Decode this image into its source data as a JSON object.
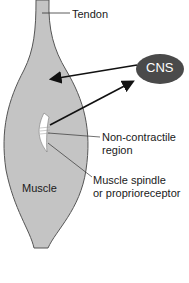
{
  "labels": {
    "tendon": "Tendon",
    "cns": "CNS",
    "non_contractile_line1": "Non-contractile",
    "non_contractile_line2": "region",
    "spindle_line1": "Muscle spindle",
    "spindle_line2": "or proprioreceptor",
    "muscle": "Muscle"
  },
  "colors": {
    "muscle_fill": "#c4c4c4",
    "muscle_outline": "#555555",
    "cns_fill": "#4a4a4a",
    "cns_text": "#ffffff",
    "arrow": "#111111",
    "spindle_fill": "#ffffff"
  }
}
